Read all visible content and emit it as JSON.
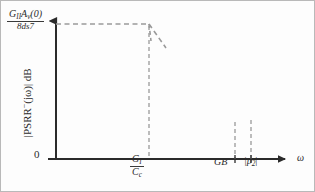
{
  "figure": {
    "type": "bode-magnitude-plot",
    "background": "#fdfdfd",
    "border_color": "#b9b9b9",
    "curve_color": "#2b2b2b",
    "asymptote_color": "#9a9a9a",
    "axis_color": "#2b2b2b"
  },
  "axes": {
    "y_title_parts": {
      "prefix": "|PSRR",
      "superscript": "−",
      "suffix": "(jω)| dB"
    },
    "y_intercept_label": {
      "numerator_g": "G",
      "numerator_g_sub": "II",
      "numerator_a": "A",
      "numerator_a_sub": "v",
      "numerator_arg": "(0)",
      "denominator": "8ds7"
    },
    "origin_label": "0",
    "x_axis_symbol": "ω"
  },
  "x_ticks": [
    {
      "name": "gi-over-cc",
      "numerator": "G",
      "numerator_sub": "I",
      "denominator": "C",
      "denominator_sub": "c",
      "x_px": 148
    },
    {
      "name": "gain-bandwidth",
      "label": "GB",
      "x_px": 234
    },
    {
      "name": "pole-two-magnitude",
      "label_open": "|p",
      "label_sub": "2",
      "label_close": "|",
      "x_px": 250
    }
  ],
  "chart_data": {
    "type": "line",
    "title": "",
    "xlabel": "ω",
    "ylabel": "|PSRR−(jω)| dB",
    "xscale": "log",
    "grid": false,
    "legend": false,
    "xlim_px": [
      55,
      290
    ],
    "ylim_px": [
      158,
      24
    ],
    "series": [
      {
        "name": "PSRR magnitude response",
        "style": "solid",
        "color": "#2b2b2b",
        "points_px": [
          [
            55,
            25
          ],
          [
            80,
            25
          ],
          [
            105,
            25
          ],
          [
            125,
            26
          ],
          [
            138,
            28
          ],
          [
            148,
            32
          ],
          [
            157,
            40
          ],
          [
            168,
            52
          ],
          [
            180,
            66
          ],
          [
            192,
            80
          ],
          [
            205,
            94
          ],
          [
            216,
            106
          ],
          [
            226,
            115
          ],
          [
            234,
            120
          ],
          [
            242,
            121
          ],
          [
            250,
            118
          ],
          [
            256,
            110
          ],
          [
            262,
            100
          ]
        ]
      },
      {
        "name": "low-frequency flat asymptote",
        "style": "dashed",
        "color": "#9a9a9a",
        "points_px": [
          [
            55,
            23
          ],
          [
            148,
            23
          ]
        ]
      },
      {
        "name": "minus 20 dB per decade asymptote",
        "style": "dashed",
        "color": "#9a9a9a",
        "points_px": [
          [
            148,
            23
          ],
          [
            165,
            47
          ]
        ]
      },
      {
        "name": "pole-zero corner drop",
        "style": "dashed",
        "color": "#9a9a9a",
        "points_px": [
          [
            148,
            23
          ],
          [
            150,
            40
          ]
        ]
      }
    ],
    "vertical_dashed_lines_px": [
      {
        "name": "gi-over-cc",
        "x": 148,
        "y_top": 25,
        "y_bottom": 158
      },
      {
        "name": "gain-bandwidth",
        "x": 234,
        "y_top": 121,
        "y_bottom": 158
      },
      {
        "name": "pole-two-magnitude",
        "x": 250,
        "y_top": 119,
        "y_bottom": 158
      }
    ]
  }
}
